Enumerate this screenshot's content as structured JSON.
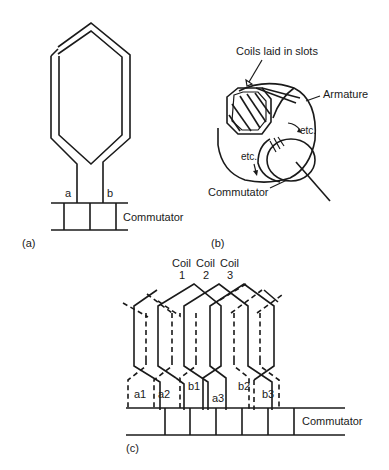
{
  "figure": {
    "panel_a": {
      "caption": "(a)",
      "terminal_a": "a",
      "terminal_b": "b",
      "commutator_label": "Commutator"
    },
    "panel_b": {
      "caption": "(b)",
      "coils_label": "Coils laid in slots",
      "armature_label": "Armature",
      "etc_upper": "etc.",
      "etc_lower": "etc.",
      "commutator_label": "Commutator"
    },
    "panel_c": {
      "caption": "(c)",
      "coil_heading": [
        "Coil",
        "Coil",
        "Coil"
      ],
      "coil_numbers": [
        "1",
        "2",
        "3"
      ],
      "terminals": [
        "a1",
        "a2",
        "b1",
        "a3",
        "b2",
        "b3"
      ],
      "commutator_label": "Commutator"
    }
  },
  "colors": {
    "line": "#1a1a1a",
    "background": "#ffffff"
  }
}
